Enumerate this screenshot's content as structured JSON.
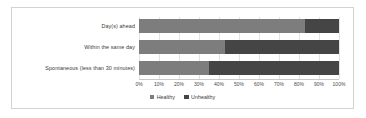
{
  "chart_data": {
    "type": "bar",
    "orientation": "horizontal",
    "stacked": true,
    "normalized": true,
    "title": "",
    "xlabel": "",
    "ylabel": "",
    "xlim": [
      0,
      100
    ],
    "grid": true,
    "legend_position": "bottom",
    "categories": [
      "Day(s) ahead",
      "Within the same day",
      "Spontaneous (less than 30 minutes)"
    ],
    "series": [
      {
        "name": "Healthy",
        "color": "#7d7d7d",
        "values": [
          83,
          43,
          35
        ]
      },
      {
        "name": "Unhealthy",
        "color": "#454545",
        "values": [
          17,
          57,
          65
        ]
      }
    ],
    "x_tick_labels": [
      "0%",
      "10%",
      "20%",
      "30%",
      "40%",
      "50%",
      "60%",
      "70%",
      "80%",
      "90%",
      "100%"
    ],
    "x_tick_values": [
      0,
      10,
      20,
      30,
      40,
      50,
      60,
      70,
      80,
      90,
      100
    ]
  },
  "legend": {
    "items": [
      {
        "label": "Healthy",
        "color": "#7d7d7d"
      },
      {
        "label": "Unhealthy",
        "color": "#454545"
      }
    ]
  }
}
